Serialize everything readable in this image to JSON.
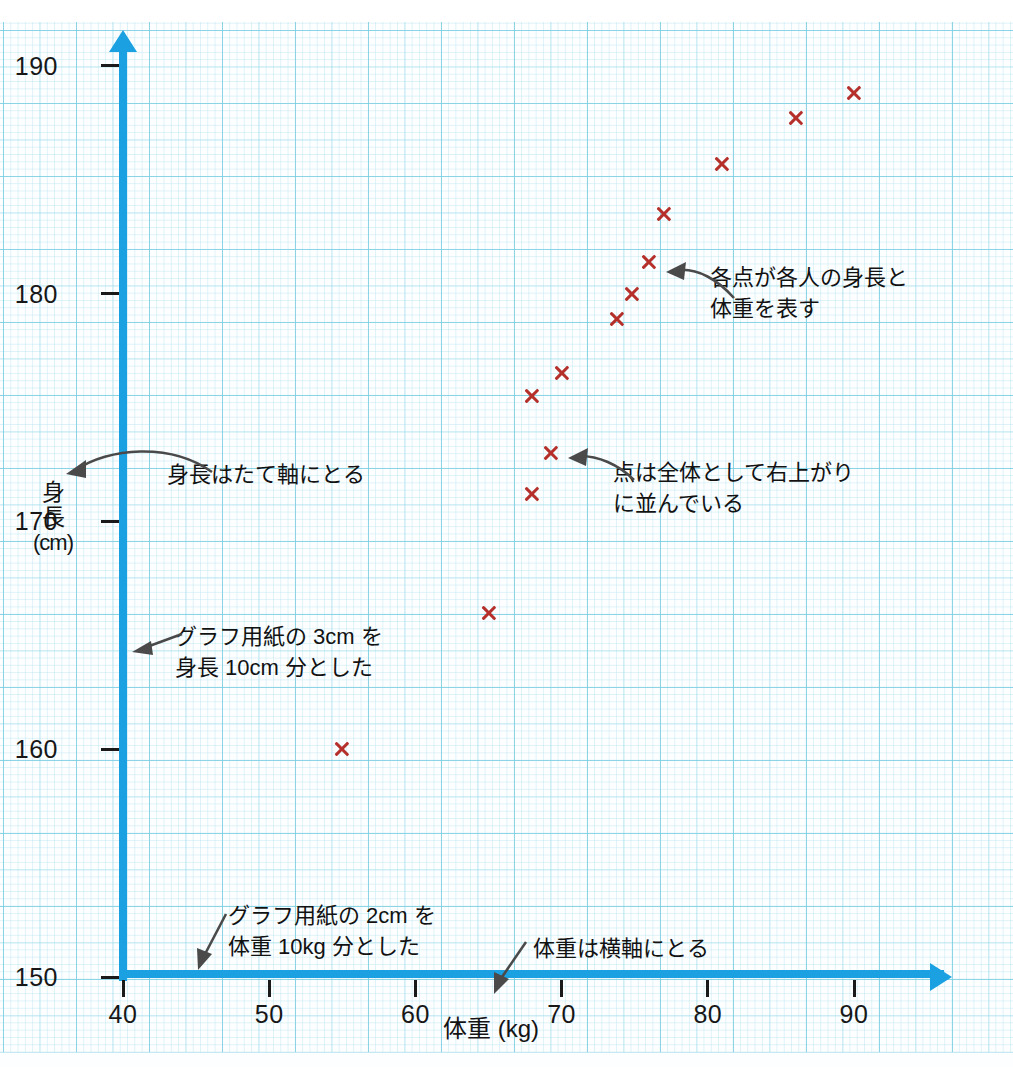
{
  "chart_data": {
    "type": "scatter",
    "title": "",
    "xlabel": "体重 (kg)",
    "ylabel": "身長 (cm)",
    "ylabel_lines": [
      "身",
      "長",
      "(cm)"
    ],
    "xlim": [
      40,
      96
    ],
    "ylim": [
      150,
      191
    ],
    "x_ticks": [
      40,
      50,
      60,
      70,
      80,
      90
    ],
    "y_ticks": [
      150,
      160,
      170,
      180,
      190
    ],
    "grid": true,
    "legend": "none",
    "marker": "x",
    "marker_color": "#b5302a",
    "axis_color": "#1ba1e2",
    "points": [
      {
        "x": 55,
        "y": 160.0
      },
      {
        "x": 65,
        "y": 166.0
      },
      {
        "x": 68,
        "y": 171.2
      },
      {
        "x": 69.3,
        "y": 173.0
      },
      {
        "x": 68,
        "y": 175.5
      },
      {
        "x": 70,
        "y": 176.5
      },
      {
        "x": 73.8,
        "y": 178.9
      },
      {
        "x": 74.8,
        "y": 180.0
      },
      {
        "x": 76,
        "y": 181.4
      },
      {
        "x": 77,
        "y": 183.5
      },
      {
        "x": 81,
        "y": 185.7
      },
      {
        "x": 86,
        "y": 187.7
      },
      {
        "x": 90,
        "y": 188.8
      }
    ]
  },
  "annotations": {
    "height_axis": "身長はたて軸にとる",
    "height_scale": "グラフ用紙の 3cm を\n身長 10cm 分とした",
    "weight_scale": "グラフ用紙の 2cm を\n体重 10kg 分とした",
    "weight_axis": "体重は横軸にとる",
    "points_meaning": "各点が各人の身長と\n体重を表す",
    "trend": "点は全体として右上がり\nに並んでいる"
  },
  "ticks": {
    "y_labels": [
      "190",
      "180",
      "170",
      "160",
      "150"
    ],
    "x_labels": [
      "40",
      "50",
      "60",
      "70",
      "80",
      "90"
    ]
  },
  "colors": {
    "axis": "#1ba1e2",
    "marker": "#b5302a",
    "grid_major": "#78cde1",
    "annotation_arrow": "#4a4a4a",
    "text": "#141414"
  }
}
